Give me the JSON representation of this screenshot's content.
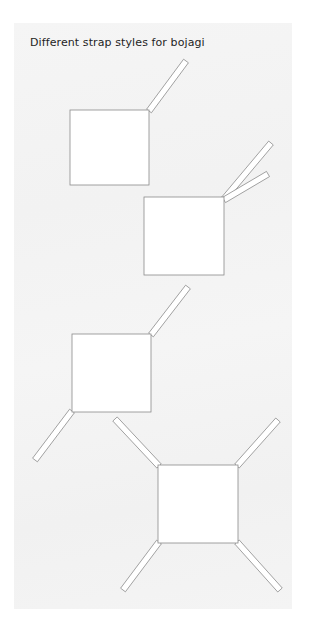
{
  "title": "Different strap styles for bojagi",
  "colors": {
    "border": "#ffffff",
    "paper": "#f4f4f4",
    "cloth_fill": "#ffffff",
    "line": "#8a8a8a",
    "text": "#1e1e1e"
  },
  "diagrams": [
    {
      "name": "single-strap",
      "square": {
        "x": 70,
        "y": 110,
        "w": 79,
        "h": 75
      },
      "straps": [
        {
          "from": [
            149,
            111
          ],
          "to": [
            186,
            61
          ]
        }
      ]
    },
    {
      "name": "double-strap",
      "square": {
        "x": 144,
        "y": 197,
        "w": 80,
        "h": 78
      },
      "straps": [
        {
          "from": [
            224,
            199
          ],
          "to": [
            271,
            143
          ]
        },
        {
          "from": [
            224,
            200
          ],
          "to": [
            268,
            174
          ]
        }
      ]
    },
    {
      "name": "two-opposite-straps",
      "square": {
        "x": 72,
        "y": 334,
        "w": 79,
        "h": 78
      },
      "straps": [
        {
          "from": [
            151,
            335
          ],
          "to": [
            188,
            287
          ]
        },
        {
          "from": [
            72,
            411
          ],
          "to": [
            35,
            460
          ]
        }
      ]
    },
    {
      "name": "four-corner-straps",
      "square": {
        "x": 158,
        "y": 465,
        "w": 80,
        "h": 78
      },
      "straps": [
        {
          "from": [
            159,
            466
          ],
          "to": [
            115,
            419
          ]
        },
        {
          "from": [
            237,
            466
          ],
          "to": [
            278,
            420
          ]
        },
        {
          "from": [
            159,
            542
          ],
          "to": [
            123,
            590
          ]
        },
        {
          "from": [
            237,
            542
          ],
          "to": [
            280,
            590
          ]
        }
      ]
    }
  ]
}
